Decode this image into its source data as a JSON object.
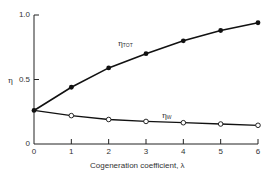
{
  "chart_data": {
    "type": "line",
    "title": "",
    "xlabel": "Cogeneration coefficient, λ",
    "ylabel": "η",
    "xlim": [
      0,
      6
    ],
    "ylim": [
      0,
      1.0
    ],
    "x_ticks": [
      "0",
      "1",
      "2",
      "3",
      "4",
      "5",
      "6"
    ],
    "y_ticks": [
      "0",
      "0.5",
      "1.0"
    ],
    "grid": false,
    "legend": "inline labels",
    "x": [
      0,
      1,
      2,
      3,
      4,
      5,
      6
    ],
    "series": [
      {
        "name": "η_TOT",
        "label_main": "η",
        "label_sub": "TOT",
        "marker": "filled-circle",
        "values": [
          0.26,
          0.44,
          0.59,
          0.7,
          0.8,
          0.88,
          0.94
        ]
      },
      {
        "name": "η_W",
        "label_main": "η",
        "label_sub": "W",
        "marker": "open-circle",
        "values": [
          0.26,
          0.22,
          0.19,
          0.175,
          0.165,
          0.155,
          0.145
        ]
      }
    ]
  }
}
